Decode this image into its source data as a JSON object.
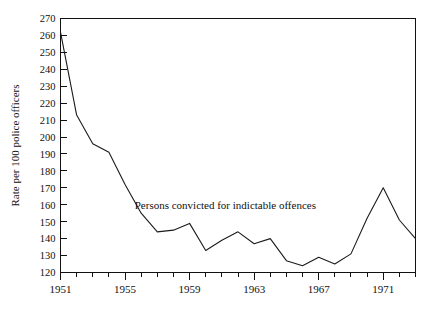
{
  "chart_data": {
    "type": "line",
    "title": "",
    "subtitle": "",
    "xlabel": "",
    "ylabel": "Rate per 100 police officers",
    "xlim": [
      1951,
      1973
    ],
    "ylim": [
      120,
      270
    ],
    "y_tick_step": 10,
    "x_tick_step": 1,
    "x_label_step": 4,
    "grid": false,
    "legend": "none",
    "annotations": [
      {
        "text": "Persons convicted for indictable offences",
        "x": 1955.6,
        "y": 160
      }
    ],
    "y_ticks": [
      120,
      130,
      140,
      150,
      160,
      170,
      180,
      190,
      200,
      210,
      220,
      230,
      240,
      250,
      260,
      270
    ],
    "y_tick_labels": [
      "120",
      "130",
      "140",
      "150",
      "160",
      "170",
      "180",
      "190",
      "200",
      "210",
      "220",
      "230",
      "240",
      "250",
      "260",
      "270"
    ],
    "x_ticks": [
      1951,
      1952,
      1953,
      1954,
      1955,
      1956,
      1957,
      1958,
      1959,
      1960,
      1961,
      1962,
      1963,
      1964,
      1965,
      1966,
      1967,
      1968,
      1969,
      1970,
      1971,
      1972,
      1973
    ],
    "x_tick_labels": [
      "1951",
      "1955",
      "1959",
      "1963",
      "1967",
      "1971"
    ],
    "x_label_values": [
      1951,
      1955,
      1959,
      1963,
      1967,
      1971
    ],
    "series": [
      {
        "name": "Persons convicted for indictable offences",
        "color": "#1b1b1b",
        "x": [
          1951,
          1952,
          1953,
          1954,
          1955,
          1956,
          1957,
          1958,
          1959,
          1960,
          1961,
          1962,
          1963,
          1964,
          1965,
          1966,
          1967,
          1968,
          1969,
          1970,
          1971,
          1972,
          1973
        ],
        "values": [
          262,
          213,
          196,
          191,
          172,
          155,
          144,
          145,
          149,
          133,
          139,
          144,
          137,
          140,
          127,
          124,
          129,
          125,
          131,
          152,
          170,
          151,
          140
        ]
      }
    ]
  },
  "axes": {
    "y_axis_title": "Rate per 100 police officers"
  }
}
